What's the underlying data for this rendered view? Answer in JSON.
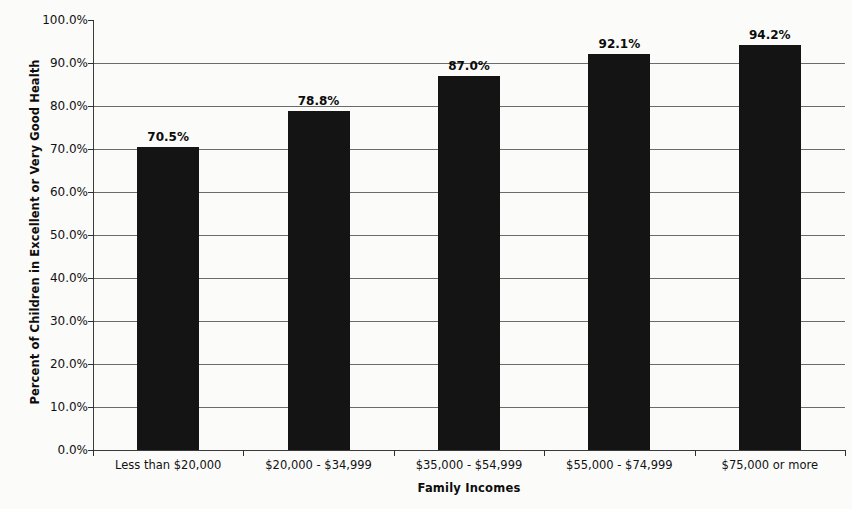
{
  "chart_data": {
    "type": "bar",
    "title": "",
    "subtitle": "",
    "xlabel": "Family Incomes",
    "ylabel": "Percent of Children in Excellent or Very Good Health",
    "categories": [
      "Less than $20,000",
      "$20,000 - $34,999",
      "$35,000 - $54,999",
      "$55,000 - $74,999",
      "$75,000 or more"
    ],
    "values": [
      70.5,
      78.8,
      87.0,
      92.1,
      94.2
    ],
    "value_labels": [
      "70.5%",
      "78.8%",
      "87.0%",
      "92.1%",
      "94.2%"
    ],
    "ylim": [
      0,
      100
    ],
    "ytick_values": [
      0,
      10,
      20,
      30,
      40,
      50,
      60,
      70,
      80,
      90,
      100
    ],
    "ytick_labels": [
      "0.0%",
      "10.0%",
      "20.0%",
      "30.0%",
      "40.0%",
      "50.0%",
      "60.0%",
      "70.0%",
      "80.0%",
      "90.0%",
      "100.0%"
    ],
    "grid": true,
    "grid_axis": "y",
    "legend": false,
    "legend_position": "none",
    "bar_color": "#141414",
    "grid_color": "#6b6b6b",
    "axis_color": "#3b3b3b",
    "background_color": "#fbfbfa",
    "series": [
      {
        "name": "Percent of Children in Excellent or Very Good Health",
        "values": [
          70.5,
          78.8,
          87.0,
          92.1,
          94.2
        ]
      }
    ]
  }
}
